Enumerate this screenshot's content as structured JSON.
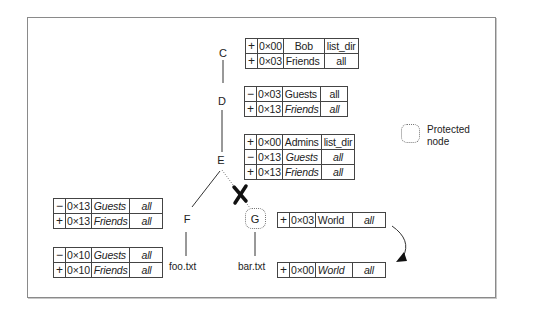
{
  "diagram": {
    "nodes": {
      "C": "C",
      "D": "D",
      "E": "E",
      "F": "F",
      "G": "G"
    },
    "leaves": {
      "foo": "foo.txt",
      "bar": "bar.txt"
    },
    "legend": {
      "line1": "Protected",
      "line2": "node"
    },
    "tables": {
      "C": [
        {
          "sign": "+",
          "mask": "0×00",
          "group": "Bob",
          "perm": "list_dir",
          "italic": false
        },
        {
          "sign": "+",
          "mask": "0×03",
          "group": "Friends",
          "perm": "all",
          "italic": false
        }
      ],
      "D": [
        {
          "sign": "−",
          "mask": "0×03",
          "group": "Guests",
          "perm": "all",
          "italic": false
        },
        {
          "sign": "+",
          "mask": "0×13",
          "group": "Friends",
          "perm": "all",
          "italic": true
        }
      ],
      "E": [
        {
          "sign": "+",
          "mask": "0×00",
          "group": "Admins",
          "perm": "list_dir",
          "italic": false
        },
        {
          "sign": "−",
          "mask": "0×13",
          "group": "Guests",
          "perm": "all",
          "italic": true
        },
        {
          "sign": "+",
          "mask": "0×13",
          "group": "Friends",
          "perm": "all",
          "italic": true
        }
      ],
      "F_upper": [
        {
          "sign": "−",
          "mask": "0×13",
          "group": "Guests",
          "perm": "all",
          "italic": true
        },
        {
          "sign": "+",
          "mask": "0×13",
          "group": "Friends",
          "perm": "all",
          "italic": true
        }
      ],
      "F_lower": [
        {
          "sign": "−",
          "mask": "0×10",
          "group": "Guests",
          "perm": "all",
          "italic": true
        },
        {
          "sign": "+",
          "mask": "0×10",
          "group": "Friends",
          "perm": "all",
          "italic": true
        }
      ],
      "G_upper": [
        {
          "sign": "+",
          "mask": "0×03",
          "group": "World",
          "perm": "all",
          "italic_group": false,
          "italic_perm": true
        }
      ],
      "G_lower": [
        {
          "sign": "+",
          "mask": "0×00",
          "group": "World",
          "perm": "all",
          "italic_group": true,
          "italic_perm": true
        }
      ]
    },
    "colors": {
      "line": "#333333",
      "dotted": "#777777",
      "cross": "#111111"
    }
  }
}
